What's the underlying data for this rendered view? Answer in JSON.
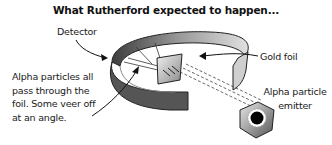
{
  "diagram": {
    "title": "What Rutherford expected to happen...",
    "labels": {
      "detector": "Detector",
      "gold_foil": "Gold foil",
      "alpha_description": "Alpha particles all pass through the foil. Some veer off at an angle.",
      "emitter": "Alpha particle emitter"
    },
    "components": [
      "detector-ring",
      "gold-foil",
      "alpha-particle-emitter",
      "alpha-particle-beams"
    ],
    "colors": {
      "ring_dark": "#4a4a4a",
      "ring_light": "#d8d8d8",
      "foil": "#bdbdbd",
      "emitter_core": "#000000"
    }
  }
}
